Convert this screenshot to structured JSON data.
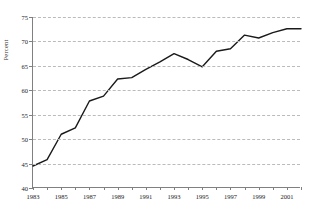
{
  "chart_data": {
    "type": "line",
    "title": "",
    "xlabel": "",
    "ylabel": "Percent",
    "xlim": [
      1983,
      2002
    ],
    "ylim": [
      40,
      75
    ],
    "yticks": [
      40,
      45,
      50,
      55,
      60,
      65,
      70,
      75
    ],
    "xticks": [
      1983,
      1984,
      1985,
      1986,
      1987,
      1988,
      1989,
      1990,
      1991,
      1992,
      1993,
      1994,
      1995,
      1996,
      1997,
      1998,
      1999,
      2000,
      2001,
      2002
    ],
    "xtick_labels": [
      "1983",
      "",
      "1985",
      "",
      "1987",
      "",
      "1989",
      "",
      "1991",
      "",
      "1993",
      "",
      "1995",
      "",
      "1997",
      "",
      "1999",
      "",
      "2001",
      ""
    ],
    "grid": "horizontal-dashed",
    "legend": "none",
    "line_color": "#1a1a1a",
    "grid_color": "#bbbbbb",
    "axis_color": "#808080",
    "x": [
      1983,
      1984,
      1985,
      1986,
      1987,
      1988,
      1989,
      1990,
      1991,
      1992,
      1993,
      1994,
      1995,
      1996,
      1997,
      1998,
      1999,
      2000,
      2001,
      2002
    ],
    "values": [
      44.5,
      45.8,
      51.0,
      52.3,
      57.8,
      58.8,
      62.3,
      62.6,
      64.3,
      65.8,
      67.5,
      66.3,
      64.8,
      68.0,
      68.5,
      71.3,
      70.7,
      71.8,
      72.6,
      72.6
    ],
    "series": [
      {
        "name": "Percent",
        "values": [
          44.5,
          45.8,
          51.0,
          52.3,
          57.8,
          58.8,
          62.3,
          62.6,
          64.3,
          65.8,
          67.5,
          66.3,
          64.8,
          68.0,
          68.5,
          71.3,
          70.7,
          71.8,
          72.6,
          72.6
        ]
      }
    ]
  }
}
